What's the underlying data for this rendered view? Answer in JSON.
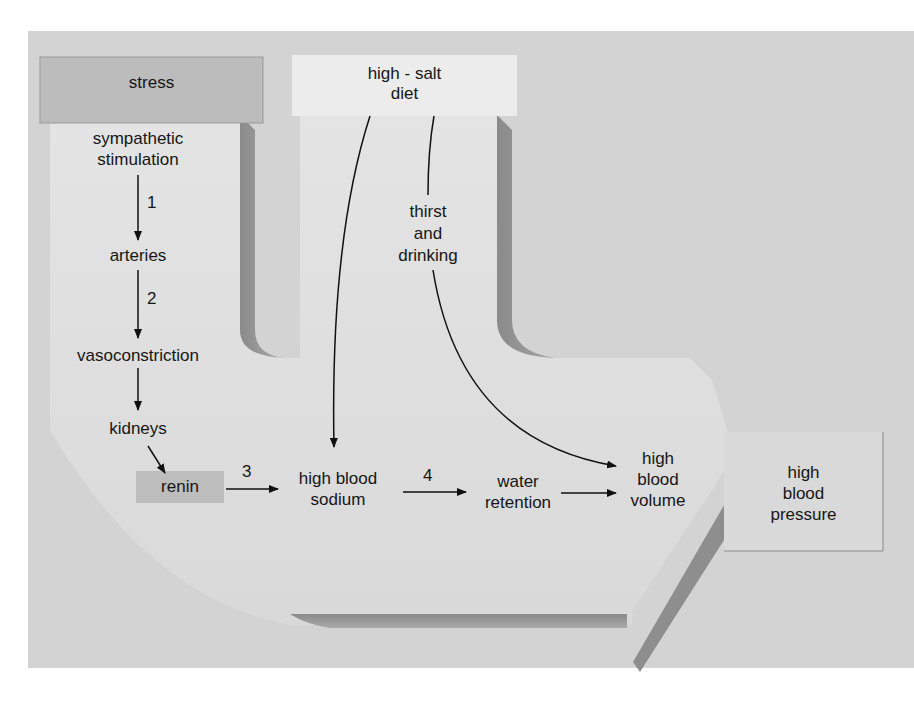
{
  "diagram": {
    "colors": {
      "background_panel": "#d4d4d4",
      "flow_arrow_fill": "#e2e2e2",
      "flow_arrow_shadow": "#8c8c8c",
      "stress_box": "#bdbdbd",
      "salt_box": "#ececec",
      "renin_box": "#bcbcbc",
      "pressure_box": "#d8d8d8",
      "line": "#111111"
    },
    "sources": {
      "stress": "stress",
      "salt_line1": "high - salt",
      "salt_line2": "diet"
    },
    "left_chain": {
      "sympathetic_line1": "sympathetic",
      "sympathetic_line2": "stimulation",
      "step1": "1",
      "arteries": "arteries",
      "step2": "2",
      "vasoconstriction": "vasoconstriction",
      "kidneys": "kidneys",
      "renin": "renin"
    },
    "thirst": {
      "line1": "thirst",
      "line2": "and",
      "line3": "drinking"
    },
    "main_chain": {
      "step3": "3",
      "sodium_line1": "high blood",
      "sodium_line2": "sodium",
      "step4": "4",
      "water_line1": "water",
      "water_line2": "retention",
      "volume_line1": "high",
      "volume_line2": "blood",
      "volume_line3": "volume"
    },
    "outcome": {
      "line1": "high",
      "line2": "blood",
      "line3": "pressure"
    },
    "edges": [
      {
        "from": "stress",
        "to": "sympathetic stimulation"
      },
      {
        "from": "sympathetic stimulation",
        "to": "arteries",
        "label": "1"
      },
      {
        "from": "arteries",
        "to": "vasoconstriction",
        "label": "2"
      },
      {
        "from": "vasoconstriction",
        "to": "kidneys"
      },
      {
        "from": "kidneys",
        "to": "renin"
      },
      {
        "from": "renin",
        "to": "high blood sodium",
        "label": "3"
      },
      {
        "from": "high-salt diet",
        "to": "high blood sodium"
      },
      {
        "from": "high-salt diet",
        "to": "thirst and drinking"
      },
      {
        "from": "thirst and drinking",
        "to": "high blood volume"
      },
      {
        "from": "high blood sodium",
        "to": "water retention",
        "label": "4"
      },
      {
        "from": "water retention",
        "to": "high blood volume"
      },
      {
        "from": "high blood volume",
        "to": "high blood pressure"
      }
    ]
  }
}
